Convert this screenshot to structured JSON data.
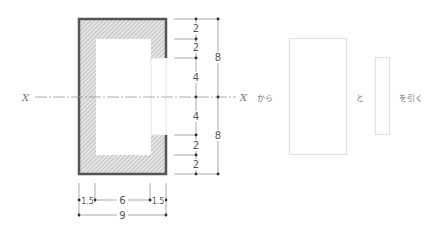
{
  "diagram": {
    "axis_label_left": "X",
    "axis_label_right": "X",
    "section": {
      "outer_width": 9,
      "outer_height": 16,
      "flange_thickness": 1.5,
      "inner_width": 6,
      "lip_height": 2,
      "colors": {
        "outline": "#555555",
        "hatch": "#b0b0b0",
        "light": "#eeeeee"
      }
    },
    "vertical_dims": {
      "segments": [
        "2",
        "2",
        "4",
        "4",
        "2",
        "2"
      ],
      "totals": [
        "8",
        "8"
      ]
    },
    "horizontal_dims": {
      "segments": [
        "1.5",
        "6",
        "1.5"
      ],
      "total": "9"
    },
    "equation": {
      "from_text": "から",
      "and_text": "と",
      "subtract_text": "を引く"
    }
  }
}
